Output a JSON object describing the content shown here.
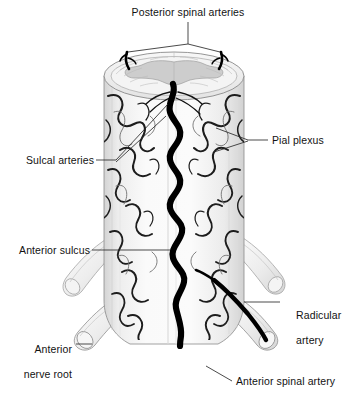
{
  "figure": {
    "background_color": "#ffffff",
    "text_color": "#121212",
    "artery_color": "#000000",
    "plexus_color": "#1a1a1a",
    "cord_fill": "#f2f2f2",
    "cord_shadow": "#d8d8d8",
    "gray_matter_fill": "#c9c9c9",
    "leader_color": "#333333"
  },
  "labels": {
    "posterior_spinal_arteries": "Posterior spinal arteries",
    "sulcal_arteries": "Sulcal arteries",
    "anterior_sulcus": "Anterior sulcus",
    "anterior_nerve_root_line1": "Anterior",
    "anterior_nerve_root_line2": "nerve root",
    "pial_plexus": "Pial plexus",
    "radicular_artery_line1": "Radicular",
    "radicular_artery_line2": "artery",
    "anterior_spinal_artery": "Anterior spinal artery"
  },
  "structures": [
    {
      "name": "posterior-spinal-arteries",
      "label": "Posterior spinal arteries",
      "side": "top",
      "count": 2
    },
    {
      "name": "sulcal-arteries",
      "label": "Sulcal arteries",
      "side": "left"
    },
    {
      "name": "anterior-sulcus",
      "label": "Anterior sulcus",
      "side": "left"
    },
    {
      "name": "anterior-nerve-root",
      "label": "Anterior nerve root",
      "side": "left"
    },
    {
      "name": "pial-plexus",
      "label": "Pial plexus",
      "side": "right"
    },
    {
      "name": "radicular-artery",
      "label": "Radicular artery",
      "side": "right"
    },
    {
      "name": "anterior-spinal-artery",
      "label": "Anterior spinal artery",
      "side": "bottom-right"
    }
  ]
}
